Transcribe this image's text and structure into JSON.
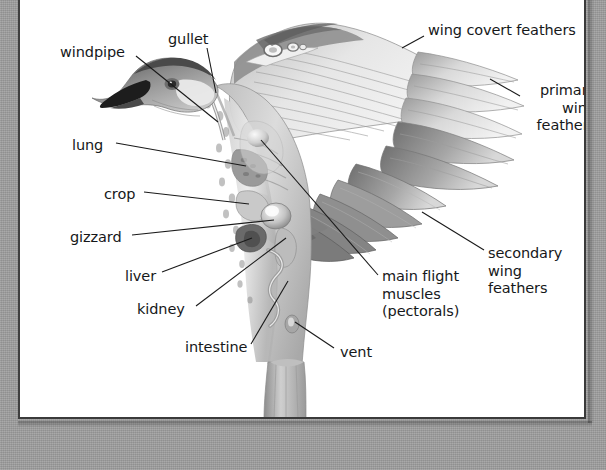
{
  "figure": {
    "plate_background": "#ffffff",
    "mount_background": "#9d9d9d",
    "label_color": "#16181a",
    "leader_line_color": "#1a1a1a"
  },
  "labels": [
    {
      "id": "windpipe",
      "text": "windpipe",
      "x": 40,
      "y": 44,
      "align": "left"
    },
    {
      "id": "gullet",
      "text": "gullet",
      "x": 148,
      "y": 31,
      "align": "left"
    },
    {
      "id": "wing-covert-feathers",
      "text": "wing covert feathers",
      "x": 408,
      "y": 22,
      "align": "left"
    },
    {
      "id": "primary-wing-feathers",
      "text": "primary\nwing\nfeathers",
      "x": 580,
      "y": 82,
      "align": "right"
    },
    {
      "id": "lung",
      "text": "lung",
      "x": 52,
      "y": 137,
      "align": "left"
    },
    {
      "id": "crop",
      "text": "crop",
      "x": 84,
      "y": 186,
      "align": "left"
    },
    {
      "id": "gizzard",
      "text": "gizzard",
      "x": 50,
      "y": 229,
      "align": "left"
    },
    {
      "id": "liver",
      "text": "liver",
      "x": 105,
      "y": 268,
      "align": "left"
    },
    {
      "id": "kidney",
      "text": "kidney",
      "x": 117,
      "y": 301,
      "align": "left"
    },
    {
      "id": "intestine",
      "text": "intestine",
      "x": 165,
      "y": 339,
      "align": "left"
    },
    {
      "id": "vent",
      "text": "vent",
      "x": 320,
      "y": 344,
      "align": "left"
    },
    {
      "id": "main-flight-muscles",
      "text": "main flight\nmuscles\n(pectorals)",
      "x": 362,
      "y": 268,
      "align": "left"
    },
    {
      "id": "secondary-wing-feathers",
      "text": "secondary wing\nfeathers",
      "x": 468,
      "y": 245,
      "align": "left"
    }
  ],
  "leader_lines": [
    {
      "id": "leader-windpipe",
      "from": [
        116,
        56
      ],
      "to": [
        198,
        122
      ]
    },
    {
      "id": "leader-gullet",
      "from": [
        187,
        48
      ],
      "to": [
        196,
        93
      ]
    },
    {
      "id": "leader-covert",
      "from": [
        404,
        36
      ],
      "to": [
        382,
        48
      ]
    },
    {
      "id": "leader-primary",
      "from": [
        500,
        96
      ],
      "to": [
        470,
        79
      ]
    },
    {
      "id": "leader-lung",
      "from": [
        96,
        143
      ],
      "to": [
        226,
        166
      ]
    },
    {
      "id": "leader-crop",
      "from": [
        124,
        192
      ],
      "to": [
        229,
        204
      ]
    },
    {
      "id": "leader-gizzard",
      "from": [
        112,
        235
      ],
      "to": [
        254,
        220
      ]
    },
    {
      "id": "leader-liver",
      "from": [
        142,
        272
      ],
      "to": [
        232,
        238
      ]
    },
    {
      "id": "leader-kidney",
      "from": [
        176,
        306
      ],
      "to": [
        266,
        238
      ]
    },
    {
      "id": "leader-intestine",
      "from": [
        231,
        344
      ],
      "to": [
        268,
        281
      ]
    },
    {
      "id": "leader-vent",
      "from": [
        314,
        348
      ],
      "to": [
        275,
        322
      ]
    },
    {
      "id": "leader-pectorals",
      "from": [
        358,
        275
      ],
      "to": [
        241,
        140
      ]
    },
    {
      "id": "leader-secondary",
      "from": [
        464,
        250
      ],
      "to": [
        402,
        212
      ]
    }
  ],
  "chart_data": {
    "type": "table",
    "categories": [
      "windpipe",
      "gullet",
      "lung",
      "crop",
      "gizzard",
      "liver",
      "kidney",
      "intestine",
      "vent",
      "main flight muscles (pectorals)",
      "wing covert feathers",
      "primary wing feathers",
      "secondary wing feathers"
    ]
  }
}
